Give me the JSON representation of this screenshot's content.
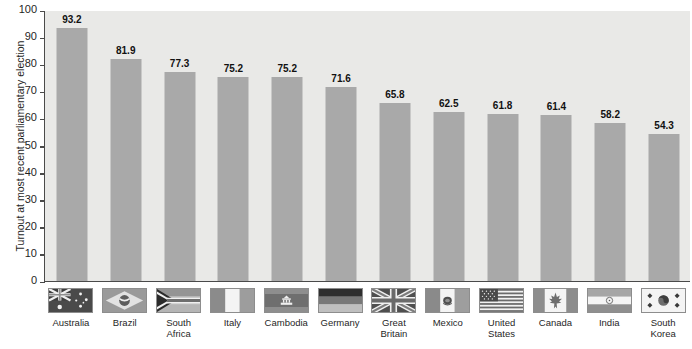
{
  "chart_data": {
    "type": "bar",
    "title": "",
    "xlabel": "",
    "ylabel": "Turnout at most recent parliamentary election",
    "ylim": [
      0,
      100
    ],
    "yticks": [
      0,
      10,
      20,
      30,
      40,
      50,
      60,
      70,
      80,
      90,
      100
    ],
    "grid": false,
    "legend": "none",
    "bar_color": "#a9a9a9",
    "plot_background": "#e9e9e7",
    "categories": [
      "Australia",
      "Brazil",
      "South Africa",
      "Italy",
      "Cambodia",
      "Germany",
      "Great Britain",
      "Mexico",
      "United States",
      "Canada",
      "India",
      "South Korea"
    ],
    "values": [
      93.2,
      81.9,
      77.3,
      75.2,
      75.2,
      71.6,
      65.8,
      62.5,
      61.8,
      61.4,
      58.2,
      54.3
    ],
    "value_labels": [
      "93.2",
      "81.9",
      "77.3",
      "75.2",
      "75.2",
      "71.6",
      "65.8",
      "62.5",
      "61.8",
      "61.4",
      "58.2",
      "54.3"
    ],
    "category_labels": [
      "Australia",
      "Brazil",
      "South\nAfrica",
      "Italy",
      "Cambodia",
      "Germany",
      "Great\nBritain",
      "Mexico",
      "United\nStates",
      "Canada",
      "India",
      "South\nKorea"
    ],
    "flag_icons": [
      "flag-australia-icon",
      "flag-brazil-icon",
      "flag-south-africa-icon",
      "flag-italy-icon",
      "flag-cambodia-icon",
      "flag-germany-icon",
      "flag-great-britain-icon",
      "flag-mexico-icon",
      "flag-united-states-icon",
      "flag-canada-icon",
      "flag-india-icon",
      "flag-south-korea-icon"
    ]
  }
}
